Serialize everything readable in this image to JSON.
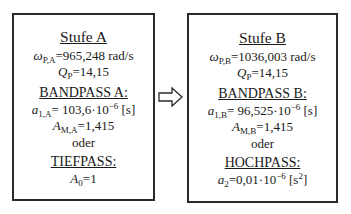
{
  "stages": [
    {
      "title": "Stufe A",
      "omega_symbol": "ω",
      "omega_sub": "P,A",
      "omega_value": "=965,248 rad/s",
      "q_symbol": "Q",
      "q_sub": "P",
      "q_value": "=14,15",
      "bandpass_label": "BANDPASS A:",
      "a1_symbol": "a",
      "a1_sub": "1,A",
      "a1_value": "= 103,6·10",
      "a1_exp": "−6",
      "a1_unit": " [s]",
      "am_symbol": "A",
      "am_sub": "M,A",
      "am_value": "=1,415",
      "oder": "oder",
      "alt_label": "TIEFPASS:",
      "alt_symbol": "A",
      "alt_sub": "0",
      "alt_value": "=1"
    },
    {
      "title": "Stufe B",
      "omega_symbol": "ω",
      "omega_sub": "P,B",
      "omega_value": "=1036,003 rad/s",
      "q_symbol": "Q",
      "q_sub": "P",
      "q_value": "=14,15",
      "bandpass_label": "BANDPASS B:",
      "a1_symbol": "a",
      "a1_sub": "1,B",
      "a1_value": "= 96,525·10",
      "a1_exp": "−6",
      "a1_unit": " [s]",
      "am_symbol": "A",
      "am_sub": "M,B",
      "am_value": "=1,415",
      "oder": "oder",
      "alt_label": "HOCHPASS:",
      "alt_symbol": "a",
      "alt_sub": "2",
      "alt_value": "=0,01·10",
      "alt_exp": "−6",
      "alt_unit_pre": " [s",
      "alt_unit_exp": "2",
      "alt_unit_post": "]"
    }
  ],
  "connector": {
    "icon": "right-arrow-icon"
  }
}
